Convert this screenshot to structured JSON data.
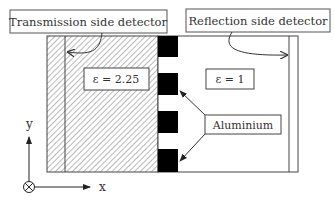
{
  "labels": {
    "transmission": "Transmission side detector",
    "reflection": "Reflection side detector",
    "eps_left": "ε  = 2.25",
    "eps_right": "ε  = 1",
    "aluminium": "Aluminium",
    "axis_y": "y",
    "axis_x": "x"
  },
  "colors": {
    "line": "#444444",
    "block": "#000000",
    "hatch": "#888888",
    "text": "#333333"
  }
}
